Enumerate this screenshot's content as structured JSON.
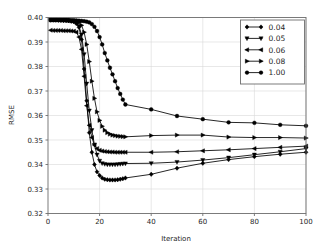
{
  "chart_data": {
    "type": "line",
    "title": "",
    "subtitle": "",
    "xlabel": "Iteration",
    "ylabel": "RMSE",
    "xlim": [
      0,
      100
    ],
    "ylim": [
      0.32,
      0.4
    ],
    "xticks": [
      0,
      20,
      40,
      60,
      80,
      100
    ],
    "xtick_labels": [
      "0",
      "20",
      "40",
      "60",
      "80",
      "100"
    ],
    "yticks": [
      0.32,
      0.33,
      0.34,
      0.35,
      0.36,
      0.37,
      0.38,
      0.39,
      0.4
    ],
    "ytick_labels": [
      "0.32",
      "0.33",
      "0.34",
      "0.35",
      "0.36",
      "0.37",
      "0.38",
      "0.39",
      "0.40"
    ],
    "grid": true,
    "grid_color": "#d9d9d9",
    "legend_position": "upper right",
    "line_color": "#000000",
    "series": [
      {
        "name": "0.04",
        "label": "0.04",
        "marker": "diamond",
        "x": [
          1,
          2,
          3,
          4,
          5,
          6,
          7,
          8,
          9,
          10,
          11,
          12,
          13,
          14,
          15,
          16,
          17,
          18,
          19,
          20,
          21,
          22,
          23,
          24,
          25,
          26,
          27,
          28,
          29,
          30,
          40,
          50,
          60,
          70,
          80,
          90,
          100
        ],
        "y": [
          0.399,
          0.399,
          0.399,
          0.3989,
          0.3989,
          0.3988,
          0.3988,
          0.3987,
          0.3985,
          0.3983,
          0.3975,
          0.396,
          0.391,
          0.379,
          0.366,
          0.353,
          0.345,
          0.34,
          0.337,
          0.3355,
          0.3345,
          0.334,
          0.3338,
          0.3337,
          0.3337,
          0.3337,
          0.3338,
          0.334,
          0.3342,
          0.3345,
          0.336,
          0.3385,
          0.3405,
          0.342,
          0.3432,
          0.3442,
          0.345
        ]
      },
      {
        "name": "0.05",
        "label": "0.05",
        "marker": "tri",
        "x": [
          1,
          2,
          3,
          4,
          5,
          6,
          7,
          8,
          9,
          10,
          11,
          12,
          13,
          14,
          15,
          16,
          17,
          18,
          19,
          20,
          21,
          22,
          23,
          24,
          25,
          26,
          27,
          28,
          29,
          30,
          40,
          50,
          60,
          70,
          80,
          90,
          100
        ],
        "y": [
          0.399,
          0.399,
          0.399,
          0.399,
          0.3989,
          0.3989,
          0.3988,
          0.3987,
          0.3986,
          0.3984,
          0.3978,
          0.3965,
          0.393,
          0.385,
          0.373,
          0.362,
          0.354,
          0.348,
          0.344,
          0.3415,
          0.3405,
          0.3402,
          0.34,
          0.34,
          0.34,
          0.34,
          0.3401,
          0.3402,
          0.3403,
          0.3404,
          0.3405,
          0.341,
          0.3418,
          0.3428,
          0.344,
          0.3452,
          0.3465
        ]
      },
      {
        "name": "0.06",
        "label": "0.06",
        "marker": "triangle-left",
        "x": [
          1,
          2,
          3,
          4,
          5,
          6,
          7,
          8,
          9,
          10,
          11,
          12,
          13,
          14,
          15,
          16,
          17,
          18,
          19,
          20,
          21,
          22,
          23,
          24,
          25,
          26,
          27,
          28,
          29,
          30,
          40,
          50,
          60,
          70,
          80,
          90,
          100
        ],
        "y": [
          0.3948,
          0.3947,
          0.3947,
          0.3947,
          0.3947,
          0.3946,
          0.3946,
          0.3946,
          0.3945,
          0.3944,
          0.394,
          0.392,
          0.387,
          0.376,
          0.364,
          0.356,
          0.351,
          0.348,
          0.3465,
          0.3458,
          0.3455,
          0.3453,
          0.3452,
          0.3451,
          0.3451,
          0.345,
          0.345,
          0.345,
          0.345,
          0.345,
          0.345,
          0.3452,
          0.3456,
          0.346,
          0.3465,
          0.347,
          0.3475
        ]
      },
      {
        "name": "0.08",
        "label": "0.08",
        "marker": "triangle-right",
        "x": [
          1,
          2,
          3,
          4,
          5,
          6,
          7,
          8,
          9,
          10,
          11,
          12,
          13,
          14,
          15,
          16,
          17,
          18,
          19,
          20,
          21,
          22,
          23,
          24,
          25,
          26,
          27,
          28,
          29,
          30,
          40,
          50,
          60,
          70,
          80,
          90,
          100
        ],
        "y": [
          0.399,
          0.399,
          0.399,
          0.399,
          0.399,
          0.3989,
          0.3989,
          0.3988,
          0.3987,
          0.3986,
          0.3984,
          0.398,
          0.3968,
          0.394,
          0.389,
          0.382,
          0.374,
          0.367,
          0.3615,
          0.358,
          0.3556,
          0.354,
          0.353,
          0.3524,
          0.352,
          0.3518,
          0.3516,
          0.3515,
          0.3514,
          0.3513,
          0.3518,
          0.352,
          0.352,
          0.3512,
          0.351,
          0.351,
          0.3508
        ]
      },
      {
        "name": "1.00",
        "label": "1.00",
        "marker": "circle",
        "x": [
          1,
          2,
          3,
          4,
          5,
          6,
          7,
          8,
          9,
          10,
          11,
          12,
          13,
          14,
          15,
          16,
          17,
          18,
          19,
          20,
          21,
          22,
          23,
          24,
          25,
          26,
          27,
          28,
          29,
          30,
          40,
          50,
          60,
          70,
          80,
          90,
          100
        ],
        "y": [
          0.399,
          0.399,
          0.399,
          0.399,
          0.399,
          0.399,
          0.399,
          0.399,
          0.3989,
          0.3989,
          0.3988,
          0.3987,
          0.3986,
          0.3985,
          0.3983,
          0.398,
          0.3973,
          0.3962,
          0.3945,
          0.392,
          0.389,
          0.3855,
          0.3825,
          0.3795,
          0.3768,
          0.374,
          0.3712,
          0.3688,
          0.3665,
          0.3645,
          0.3625,
          0.3598,
          0.3585,
          0.3572,
          0.357,
          0.3562,
          0.3558
        ]
      }
    ]
  }
}
